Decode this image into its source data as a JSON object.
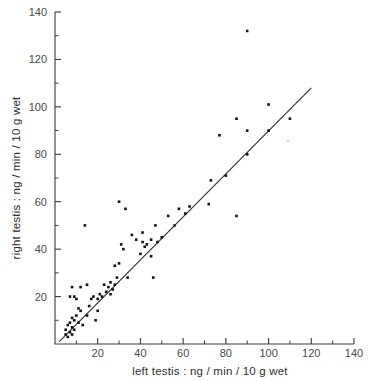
{
  "chart_data": {
    "type": "scatter",
    "title": "",
    "xlabel": "left testis : ng / min / 10 g wet",
    "ylabel": "right testis : ng / min / 10 g wet",
    "xlim": [
      0,
      140
    ],
    "ylim": [
      0,
      140
    ],
    "xticks": [
      20,
      40,
      60,
      80,
      100,
      120,
      140
    ],
    "xtick_labels": [
      "20",
      "40",
      "60",
      "80",
      "100",
      "120",
      "140"
    ],
    "yticks": [
      20,
      40,
      60,
      80,
      100,
      120,
      140
    ],
    "ytick_labels": [
      "20",
      "40",
      "60",
      "80",
      "100",
      "120",
      "140"
    ],
    "minor_tick_step": 10,
    "grid": false,
    "legend": null,
    "marker": "square",
    "marker_color": "#111111",
    "points": [
      [
        5,
        4
      ],
      [
        5,
        6
      ],
      [
        6,
        3
      ],
      [
        6,
        8
      ],
      [
        7,
        5
      ],
      [
        7,
        9
      ],
      [
        7,
        20
      ],
      [
        8,
        4
      ],
      [
        8,
        7
      ],
      [
        8,
        11
      ],
      [
        8,
        24
      ],
      [
        9,
        6
      ],
      [
        9,
        10
      ],
      [
        9,
        20
      ],
      [
        10,
        12
      ],
      [
        10,
        19
      ],
      [
        11,
        9
      ],
      [
        11,
        15
      ],
      [
        12,
        14
      ],
      [
        12,
        24
      ],
      [
        13,
        8
      ],
      [
        14,
        50
      ],
      [
        15,
        12
      ],
      [
        15,
        25
      ],
      [
        16,
        16
      ],
      [
        17,
        19
      ],
      [
        18,
        20
      ],
      [
        19,
        10
      ],
      [
        20,
        14
      ],
      [
        20,
        19
      ],
      [
        21,
        21
      ],
      [
        22,
        20
      ],
      [
        23,
        25
      ],
      [
        24,
        22
      ],
      [
        25,
        24
      ],
      [
        26,
        21
      ],
      [
        26,
        26
      ],
      [
        27,
        23
      ],
      [
        28,
        25
      ],
      [
        28,
        33
      ],
      [
        29,
        28
      ],
      [
        30,
        34
      ],
      [
        30,
        60
      ],
      [
        31,
        42
      ],
      [
        32,
        40
      ],
      [
        33,
        57
      ],
      [
        34,
        28
      ],
      [
        36,
        46
      ],
      [
        38,
        44
      ],
      [
        40,
        38
      ],
      [
        41,
        43
      ],
      [
        41,
        47
      ],
      [
        42,
        41
      ],
      [
        43,
        42
      ],
      [
        45,
        37
      ],
      [
        45,
        44
      ],
      [
        46,
        28
      ],
      [
        47,
        50
      ],
      [
        48,
        43
      ],
      [
        50,
        45
      ],
      [
        53,
        54
      ],
      [
        56,
        50
      ],
      [
        58,
        57
      ],
      [
        61,
        55
      ],
      [
        63,
        58
      ],
      [
        72,
        59
      ],
      [
        73,
        69
      ],
      [
        77,
        88
      ],
      [
        80,
        71
      ],
      [
        85,
        54
      ],
      [
        85,
        95
      ],
      [
        90,
        80
      ],
      [
        90,
        90
      ],
      [
        90,
        132
      ],
      [
        100,
        90
      ],
      [
        100,
        101
      ],
      [
        110,
        95
      ]
    ],
    "fit_line": {
      "type": "line",
      "x": [
        2,
        120
      ],
      "y": [
        1,
        108
      ],
      "label": "regression line"
    }
  },
  "axis_titles": {
    "x": "left testis : ng / min / 10 g wet",
    "y": "right testis : ng / min / 10 g wet"
  }
}
